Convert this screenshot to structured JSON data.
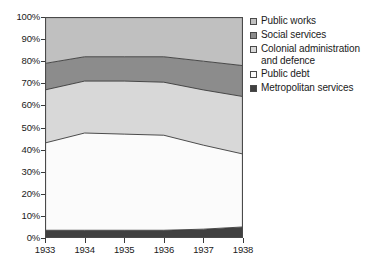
{
  "chart_data": {
    "type": "area",
    "stacked": true,
    "normalized": true,
    "title": "",
    "xlabel": "",
    "ylabel": "",
    "categories": [
      "1933",
      "1934",
      "1935",
      "1936",
      "1937",
      "1938"
    ],
    "x": [
      1933,
      1934,
      1935,
      1936,
      1937,
      1938
    ],
    "ylim": [
      0,
      100
    ],
    "ytick_labels": [
      "0%",
      "10%",
      "20%",
      "30%",
      "40%",
      "50%",
      "60%",
      "70%",
      "80%",
      "90%",
      "100%"
    ],
    "ytick_values": [
      0,
      10,
      20,
      30,
      40,
      50,
      60,
      70,
      80,
      90,
      100
    ],
    "grid": false,
    "legend_position": "right",
    "series": [
      {
        "name": "Metropolitan services",
        "color": "#404040",
        "values": [
          3.5,
          3.5,
          3.5,
          3.5,
          4.0,
          5.0
        ],
        "cumulative_top": [
          3.5,
          3.5,
          3.5,
          3.5,
          4.0,
          5.0
        ]
      },
      {
        "name": "Public debt",
        "color": "#fbfbfb",
        "values": [
          39.5,
          44.0,
          43.5,
          43.0,
          38.0,
          33.0
        ],
        "cumulative_top": [
          43.0,
          47.5,
          47.0,
          46.5,
          42.0,
          38.0
        ]
      },
      {
        "name": "Colonial administration and defence",
        "color": "#d8d8d8",
        "values": [
          24.0,
          23.5,
          24.0,
          24.0,
          25.0,
          26.0
        ],
        "cumulative_top": [
          67.0,
          71.0,
          71.0,
          70.5,
          67.0,
          64.0
        ]
      },
      {
        "name": "Social services",
        "color": "#8c8c8c",
        "values": [
          12.0,
          11.0,
          11.0,
          11.5,
          13.0,
          14.0
        ],
        "cumulative_top": [
          79.0,
          82.0,
          82.0,
          82.0,
          80.0,
          78.0
        ]
      },
      {
        "name": "Public works",
        "color": "#c0c0c0",
        "values": [
          21.0,
          18.0,
          18.0,
          18.0,
          20.0,
          22.0
        ],
        "cumulative_top": [
          100.0,
          100.0,
          100.0,
          100.0,
          100.0,
          100.0
        ]
      }
    ]
  },
  "legend": {
    "items": [
      {
        "label": "Public works",
        "color": "#c0c0c0"
      },
      {
        "label": "Social services",
        "color": "#8c8c8c"
      },
      {
        "label": "Colonial administration\nand defence",
        "color": "#d8d8d8"
      },
      {
        "label": "Public debt",
        "color": "#fbfbfb"
      },
      {
        "label": "Metropolitan services",
        "color": "#404040"
      }
    ]
  },
  "axes": {
    "y_labels": [
      "100%",
      "90%",
      "80%",
      "70%",
      "60%",
      "50%",
      "40%",
      "30%",
      "20%",
      "10%",
      "0%"
    ],
    "x_labels": [
      "1933",
      "1934",
      "1935",
      "1936",
      "1937",
      "1938"
    ]
  },
  "style": {
    "frame_color": "#4a4a4a",
    "text_color": "#1a1a1a",
    "background": "#ffffff"
  }
}
